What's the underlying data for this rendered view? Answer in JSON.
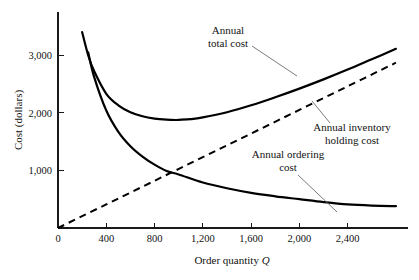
{
  "chart_data": {
    "type": "line",
    "title": "",
    "xlabel": "Order quantity Q",
    "xlabel_main": "Order quantity",
    "xlabel_symbol": "Q",
    "ylabel": "Cost (dollars)",
    "xlim": [
      0,
      2900
    ],
    "ylim": [
      0,
      3750
    ],
    "grid": false,
    "legend_position": "inline-annotations",
    "x_ticks": [
      {
        "value": 0,
        "label": "0"
      },
      {
        "value": 400,
        "label": "400"
      },
      {
        "value": 800,
        "label": "800"
      },
      {
        "value": 1200,
        "label": "1,200"
      },
      {
        "value": 1600,
        "label": "1,600"
      },
      {
        "value": 2000,
        "label": "2,000"
      },
      {
        "value": 2400,
        "label": "2,400"
      }
    ],
    "y_ticks": [
      {
        "value": 1000,
        "label": "1,000"
      },
      {
        "value": 2000,
        "label": "2,000"
      },
      {
        "value": 3000,
        "label": "3,000"
      }
    ],
    "series": [
      {
        "name": "Annual total cost",
        "style": "solid",
        "x": [
          200,
          250,
          300,
          400,
          500,
          600,
          700,
          800,
          900,
          975,
          1000,
          1100,
          1200,
          1400,
          1600,
          1800,
          2000,
          2200,
          2400,
          2600,
          2800
        ],
        "values": [
          3400,
          3000,
          2720,
          2330,
          2130,
          2010,
          1940,
          1900,
          1880,
          1875,
          1878,
          1890,
          1920,
          2010,
          2130,
          2270,
          2420,
          2580,
          2750,
          2930,
          3110
        ]
      },
      {
        "name": "Annual inventory holding cost",
        "style": "dashed",
        "x": [
          0,
          400,
          800,
          1200,
          1600,
          2000,
          2400,
          2800
        ],
        "values": [
          0,
          410,
          820,
          1230,
          1640,
          2050,
          2460,
          2870
        ]
      },
      {
        "name": "Annual ordering cost",
        "style": "solid",
        "x": [
          250,
          300,
          400,
          500,
          600,
          700,
          800,
          900,
          1000,
          1200,
          1400,
          1600,
          1800,
          2000,
          2200,
          2400,
          2600,
          2800
        ],
        "values": [
          3050,
          2620,
          2040,
          1670,
          1420,
          1240,
          1100,
          990,
          930,
          790,
          690,
          610,
          550,
          500,
          450,
          410,
          390,
          380
        ]
      }
    ],
    "annotations": [
      {
        "name": "annual-total-cost",
        "lines": [
          "Annual",
          "total cost"
        ],
        "text_x": 228,
        "text_y": 34,
        "leader_from_x": 252,
        "leader_from_y": 46,
        "leader_to_x": 297,
        "leader_to_y": 76
      },
      {
        "name": "annual-inventory-holding-cost",
        "lines": [
          "Annual inventory",
          "holding cost"
        ],
        "text_x": 352,
        "text_y": 131,
        "leader_from_x": 330,
        "leader_from_y": 123,
        "leader_to_x": 312,
        "leader_to_y": 101
      },
      {
        "name": "annual-ordering-cost",
        "lines": [
          "Annual ordering",
          "cost"
        ],
        "text_x": 288,
        "text_y": 158,
        "leader_from_x": 298,
        "leader_from_y": 175,
        "leader_to_x": 337,
        "leader_to_y": 212
      }
    ]
  },
  "plot_geometry": {
    "origin_x": 58,
    "origin_y": 228,
    "axis_top_y": 12,
    "axis_right_x": 408,
    "x_scale_px_per_unit": 0.12,
    "y_scale_px_per_unit": 0.058
  }
}
